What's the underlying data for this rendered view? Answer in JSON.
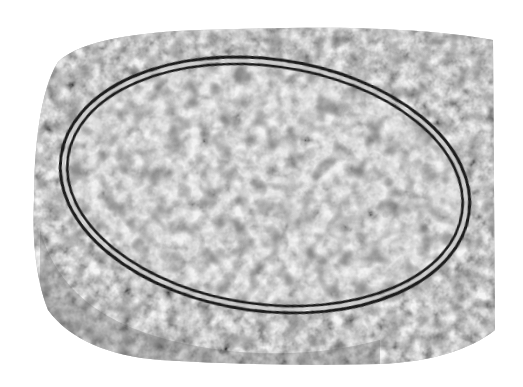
{
  "image": {
    "kind": "transmission electron micrograph",
    "description": "Grayscale micrograph of an oval double-membrane-bounded organelle/vesicle containing dark granular particles, surrounded by granular cytoplasm; irregular white border",
    "colors": {
      "background": "#ffffff",
      "cytoplasm": "#9a9a9a",
      "interior": "#d8d8d8",
      "membrane": "#1e1e1e",
      "granules": "#3a3a3a"
    },
    "specimen_bounds": {
      "x": 30,
      "y": 28,
      "width": 465,
      "height": 337
    },
    "organelle": {
      "cx": 265,
      "cy": 185,
      "rx": 205,
      "ry": 125,
      "rotation_deg": 8
    }
  }
}
